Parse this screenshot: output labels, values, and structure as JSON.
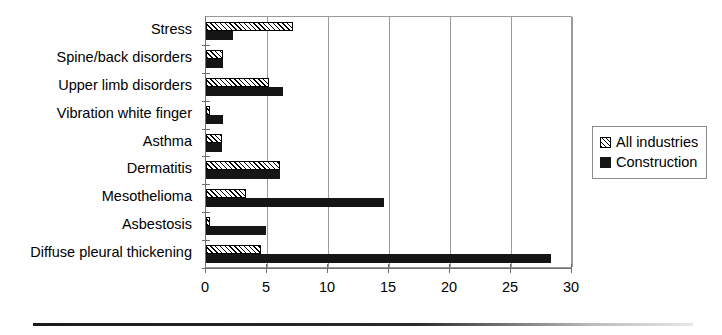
{
  "chart_data": {
    "type": "bar",
    "orientation": "horizontal",
    "title": "",
    "xlabel": "",
    "ylabel": "",
    "xlim": [
      0,
      30
    ],
    "xticks": [
      0,
      5,
      10,
      15,
      20,
      25,
      30
    ],
    "xtick_labels": [
      "0",
      "5",
      "10",
      "15",
      "20",
      "25",
      "30"
    ],
    "grid": true,
    "grid_axis": "x",
    "legend_position": "right",
    "categories": [
      "Stress",
      "Spine/back disorders",
      "Upper limb disorders",
      "Vibration white finger",
      "Asthma",
      "Dermatitis",
      "Mesothelioma",
      "Asbestosis",
      "Diffuse pleural thickening"
    ],
    "series": [
      {
        "name": "All industries",
        "fill": "hatched",
        "color": "#ffffff",
        "values": [
          7.1,
          1.4,
          5.2,
          0.3,
          1.3,
          6.1,
          3.3,
          0.3,
          4.5
        ]
      },
      {
        "name": "Construction",
        "fill": "solid",
        "color": "#151515",
        "values": [
          2.2,
          1.4,
          6.3,
          1.4,
          1.3,
          6.1,
          14.6,
          4.9,
          28.3
        ]
      }
    ]
  },
  "legend": {
    "items": [
      {
        "label": "All industries",
        "swatch": "hatched-swatch-icon"
      },
      {
        "label": "Construction",
        "swatch": "solid-swatch-icon"
      }
    ]
  }
}
